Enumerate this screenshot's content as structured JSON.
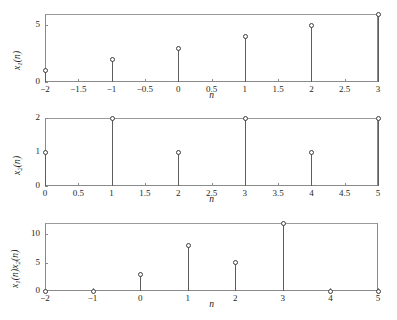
{
  "figure": {
    "title": "",
    "background": "#ffffff",
    "axis_color": "#8a8a8a",
    "stem_color": "#5d5d5d",
    "marker_color": "#3d3d3d"
  },
  "chart_data": [
    {
      "type": "scatter",
      "plot_style": "stem",
      "index": 0,
      "title": "",
      "xlabel": "n",
      "ylabel": "x1(n)",
      "ylabel_parts": {
        "base": "x",
        "sub": "1",
        "arg": "(n)"
      },
      "x": [
        -2,
        -1,
        0,
        1,
        2,
        3
      ],
      "values": [
        1,
        2,
        3,
        4,
        5,
        6
      ],
      "xlim": [
        -2,
        3
      ],
      "ylim": [
        0,
        6
      ],
      "xticks": [
        -2,
        -1.5,
        -1,
        -0.5,
        0,
        0.5,
        1,
        1.5,
        2,
        2.5,
        3
      ],
      "xtick_labels": [
        "-2",
        "-1.5",
        "-1",
        "-0.5",
        "0",
        "0.5",
        "1",
        "1.5",
        "2",
        "2.5",
        "3"
      ],
      "yticks": [
        0,
        5
      ],
      "ytick_labels": [
        "0",
        "5"
      ],
      "grid": false,
      "legend": null
    },
    {
      "type": "scatter",
      "plot_style": "stem",
      "index": 1,
      "title": "",
      "xlabel": "n",
      "ylabel": "x2(n)",
      "ylabel_parts": {
        "base": "x",
        "sub": "2",
        "arg": "(n)"
      },
      "x": [
        0,
        1,
        2,
        3,
        4,
        5
      ],
      "values": [
        1,
        2,
        1,
        2,
        1,
        2
      ],
      "xlim": [
        0,
        5
      ],
      "ylim": [
        0,
        2
      ],
      "xticks": [
        0,
        0.5,
        1,
        1.5,
        2,
        2.5,
        3,
        3.5,
        4,
        4.5,
        5
      ],
      "xtick_labels": [
        "0",
        "0.5",
        "1",
        "1.5",
        "2",
        "2.5",
        "3",
        "3.5",
        "4",
        "4.5",
        "5"
      ],
      "yticks": [
        0,
        1,
        2
      ],
      "ytick_labels": [
        "0",
        "1",
        "2"
      ],
      "grid": false,
      "legend": null
    },
    {
      "type": "scatter",
      "plot_style": "stem",
      "index": 2,
      "title": "",
      "xlabel": "n",
      "ylabel": "x1(n)x2(n)",
      "ylabel_parts": {
        "base": "x",
        "sub": "1",
        "arg": "(n)",
        "base2": "x",
        "sub2": "2",
        "arg2": "(n)"
      },
      "x": [
        -2,
        -1,
        0,
        1,
        2,
        3,
        4,
        5
      ],
      "values": [
        0,
        0,
        3,
        8,
        5,
        12,
        0,
        0
      ],
      "xlim": [
        -2,
        5
      ],
      "ylim": [
        0,
        12
      ],
      "xticks": [
        -2,
        -1,
        0,
        1,
        2,
        3,
        4,
        5
      ],
      "xtick_labels": [
        "-2",
        "-1",
        "0",
        "1",
        "2",
        "3",
        "4",
        "5"
      ],
      "yticks": [
        0,
        5,
        10
      ],
      "ytick_labels": [
        "0",
        "5",
        "10"
      ],
      "grid": false,
      "legend": null
    }
  ]
}
